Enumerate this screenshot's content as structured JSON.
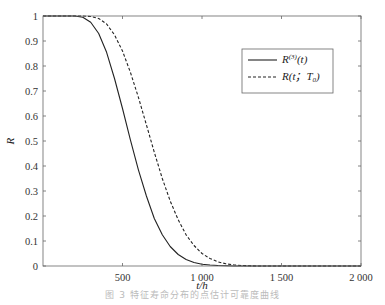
{
  "chart_data": {
    "type": "line",
    "title": "",
    "xlabel": "t/h",
    "ylabel": "R",
    "xlim": [
      0,
      2000
    ],
    "ylim": [
      0,
      1
    ],
    "grid": false,
    "legend_position": "upper right",
    "x_ticks": [
      500,
      1000,
      1500,
      2000
    ],
    "x_tick_labels": [
      "500",
      "1 000",
      "1 500",
      "2 000"
    ],
    "y_ticks": [
      0,
      0.1,
      0.2,
      0.3,
      0.4,
      0.5,
      0.6,
      0.7,
      0.8,
      0.9,
      1
    ],
    "y_tick_labels": [
      "0",
      "0.1",
      "0.2",
      "0.3",
      "0.4",
      "0.5",
      "0.6",
      "0.7",
      "0.8",
      "0.9",
      "1"
    ],
    "x": [
      0,
      100,
      200,
      250,
      300,
      350,
      400,
      450,
      500,
      550,
      600,
      650,
      700,
      750,
      800,
      850,
      900,
      950,
      1000,
      1050,
      1100,
      1150,
      1200,
      1250,
      1300,
      1350,
      1400,
      1500,
      1600,
      1800,
      2000
    ],
    "series": [
      {
        "name": "R^(3)(t)",
        "style": "solid",
        "values": [
          1.0,
          1.0,
          1.0,
          0.995,
          0.975,
          0.93,
          0.855,
          0.75,
          0.63,
          0.505,
          0.385,
          0.28,
          0.19,
          0.125,
          0.078,
          0.046,
          0.026,
          0.014,
          0.007,
          0.004,
          0.002,
          0.001,
          0.0,
          0.0,
          0.0,
          0.0,
          0.0,
          0.0,
          0.0,
          0.0,
          0.0
        ]
      },
      {
        "name": "R(t; T0)",
        "style": "dashed",
        "values": [
          1.0,
          1.0,
          1.0,
          1.0,
          0.998,
          0.99,
          0.968,
          0.925,
          0.86,
          0.775,
          0.675,
          0.565,
          0.455,
          0.35,
          0.26,
          0.185,
          0.125,
          0.082,
          0.05,
          0.03,
          0.017,
          0.009,
          0.005,
          0.002,
          0.001,
          0.0,
          0.0,
          0.0,
          0.0,
          0.0,
          0.0
        ]
      }
    ]
  },
  "legend": {
    "items": [
      {
        "label_main": "R",
        "label_sup": "(3)",
        "label_tail": "(t)",
        "style": "solid"
      },
      {
        "label_main": "R(t；T",
        "label_sub": "0",
        "label_tail": ")",
        "style": "dashed"
      }
    ]
  },
  "caption": "图 3   特征寿命分布的点估计可靠度曲线",
  "colors": {
    "line": "#222222",
    "axis": "#666666",
    "background": "#ffffff"
  }
}
